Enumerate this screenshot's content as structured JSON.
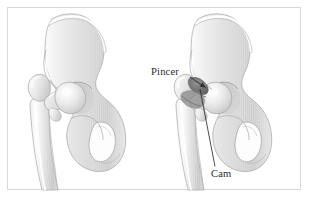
{
  "figure": {
    "kind": "anatomical-illustration",
    "style": "grayscale-airbrush-medical-drawing",
    "background_color": "#ffffff",
    "frame": {
      "present": true,
      "color": "#d8d8d8",
      "x": 7,
      "y": 7,
      "width": 294,
      "height": 183
    },
    "panels": [
      {
        "id": "left-panel",
        "role": "normal-hip",
        "caption": "",
        "center_x": 82,
        "center_y": 100
      },
      {
        "id": "right-panel",
        "role": "impingement-hip",
        "caption": "",
        "center_x": 228,
        "center_y": 100
      }
    ]
  },
  "labels": [
    {
      "id": "pincer",
      "text": "Pincer",
      "x": 151,
      "y": 67,
      "color": "#2b2b2b",
      "leader": {
        "type": "arrow",
        "from_x": 190,
        "from_y": 77,
        "to_x": 206,
        "to_y": 88
      },
      "points_to": "acetabular-rim-overcoverage"
    },
    {
      "id": "cam",
      "text": "Cam",
      "x": 211,
      "y": 169,
      "color": "#2b2b2b",
      "leader": {
        "type": "line",
        "from_x": 215,
        "from_y": 167,
        "to_x": 200,
        "to_y": 89
      },
      "points_to": "femoral-head-neck-junction-bump"
    }
  ],
  "anatomy": {
    "structures": [
      "ilium",
      "acetabulum",
      "femoral-head",
      "femoral-neck",
      "greater-trochanter",
      "lesser-trochanter",
      "femoral-shaft",
      "superior-pubic-ramus",
      "ischium",
      "obturator-foramen"
    ],
    "bone_fill_light": "#f2f2f2",
    "bone_fill_mid": "#d9d9d9",
    "bone_fill_dark": "#b5b5b5",
    "outline_color": "#9a9a9a",
    "lesion_shadow_color": "#6e6e6e"
  }
}
